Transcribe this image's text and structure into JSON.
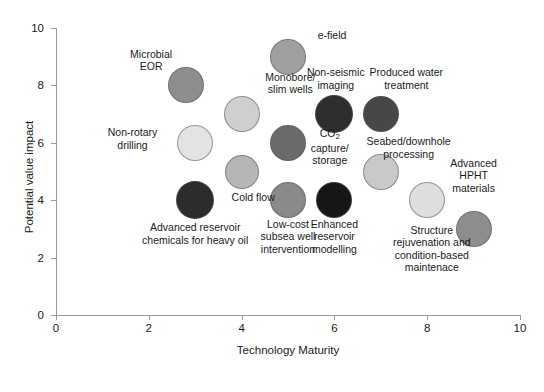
{
  "chart_data": {
    "type": "scatter",
    "title": "",
    "xlabel": "Technology Maturity",
    "ylabel": "Potential value impact",
    "xlim": [
      0,
      10
    ],
    "ylim": [
      0,
      10
    ],
    "xticks": [
      "0",
      "2",
      "4",
      "6",
      "8",
      "10"
    ],
    "yticks": [
      "0",
      "2",
      "4",
      "6",
      "8",
      "10"
    ],
    "grid": false,
    "legend": "none",
    "points": [
      {
        "label": "Microbial\nEOR",
        "x": 2.8,
        "y": 8.0,
        "radius_px": 18,
        "color": "#8d8d8d",
        "label_x": 2.05,
        "label_y": 8.9
      },
      {
        "label": "Monobore/\nslim wells",
        "x": 4.0,
        "y": 7.0,
        "radius_px": 18,
        "color": "#cfcfcf",
        "label_x": 5.05,
        "label_y": 8.1
      },
      {
        "label": "e-field",
        "x": 5.0,
        "y": 9.0,
        "radius_px": 18,
        "color": "#a0a0a0",
        "label_x": 5.95,
        "label_y": 9.75
      },
      {
        "label": "Non-seismic\nimaging",
        "x": 6.0,
        "y": 7.0,
        "radius_px": 19,
        "color": "#2e2e2e",
        "label_x": 6.03,
        "label_y": 8.25
      },
      {
        "label": "Produced water\ntreatment",
        "x": 7.0,
        "y": 7.0,
        "radius_px": 18,
        "color": "#474747",
        "label_x": 7.55,
        "label_y": 8.25
      },
      {
        "label": "Non-rotary\ndrilling",
        "x": 3.0,
        "y": 6.0,
        "radius_px": 18,
        "color": "#e3e3e3",
        "label_x": 1.65,
        "label_y": 6.15
      },
      {
        "label": "CO2capture/\nstorage",
        "label_rich": true,
        "x": 5.0,
        "y": 6.0,
        "radius_px": 18,
        "color": "#6a6a6a",
        "label_x": 5.9,
        "label_y": 5.85
      },
      {
        "label": "Seabed/downhole\nprocessing",
        "x": 7.0,
        "y": 5.0,
        "radius_px": 18,
        "color": "#c9c9c9",
        "label_x": 7.6,
        "label_y": 5.85
      },
      {
        "label": "Cold flow",
        "x": 4.0,
        "y": 5.0,
        "radius_px": 17,
        "color": "#b6b6b6",
        "label_x": 4.25,
        "label_y": 4.12
      },
      {
        "label": "Advanced HPHT\nmaterials",
        "x": 8.0,
        "y": 4.0,
        "radius_px": 18,
        "color": "#dedede",
        "label_x": 9.0,
        "label_y": 4.85
      },
      {
        "label": "Advanced reservoir\nchemicals for heavy oil",
        "x": 3.0,
        "y": 4.0,
        "radius_px": 19,
        "color": "#2c2c2c",
        "label_x": 3.0,
        "label_y": 2.85
      },
      {
        "label": "Low-cost\nsubsea well\nintervention",
        "x": 5.0,
        "y": 4.0,
        "radius_px": 18,
        "color": "#8a8a8a",
        "label_x": 5.0,
        "label_y": 2.72
      },
      {
        "label": "Enhanced\nreservoir\nmodelling",
        "x": 6.0,
        "y": 4.0,
        "radius_px": 18,
        "color": "#161616",
        "label_x": 6.0,
        "label_y": 2.72
      },
      {
        "label": "Structure\nrejuvenation and\ncondition-based\nmaintenace",
        "x": 9.0,
        "y": 3.0,
        "radius_px": 18,
        "color": "#8d8d8d",
        "label_x": 8.1,
        "label_y": 2.3
      }
    ]
  }
}
